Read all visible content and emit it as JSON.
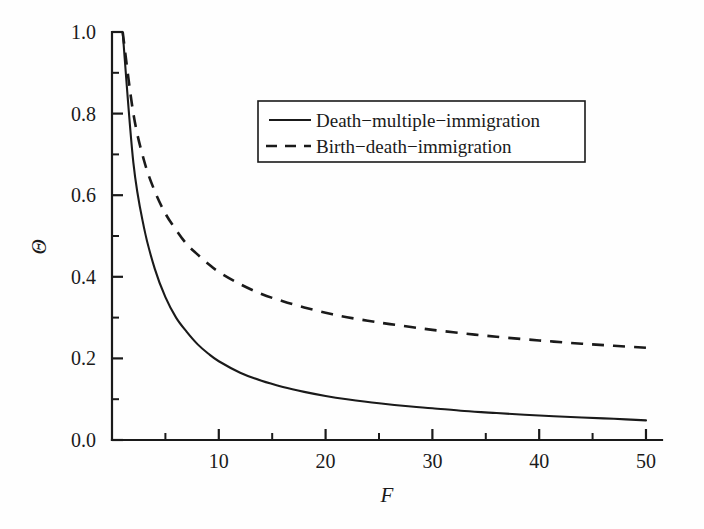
{
  "chart_data": {
    "type": "line",
    "title": "",
    "xlabel": "F",
    "ylabel": "Θ",
    "xlim": [
      0,
      51.5
    ],
    "ylim": [
      0.0,
      1.05
    ],
    "grid": false,
    "legend_position": "upper-center-right",
    "x_ticks_major": [
      10,
      20,
      30,
      40,
      50
    ],
    "x_ticks_major_labels": [
      "10",
      "20",
      "30",
      "40",
      "50"
    ],
    "x_ticks_minor": [
      5,
      15,
      25,
      35,
      45
    ],
    "y_ticks_major": [
      0.0,
      0.2,
      0.4,
      0.6,
      0.8,
      1.0
    ],
    "y_ticks_major_labels": [
      "0.0",
      "0.2",
      "0.4",
      "0.6",
      "0.8",
      "1.0"
    ],
    "y_ticks_minor": [
      0.1,
      0.3,
      0.5,
      0.7,
      0.9
    ],
    "x": [
      1,
      2,
      3,
      4,
      5,
      6,
      7,
      8,
      9,
      10,
      12,
      14,
      16,
      18,
      20,
      22,
      25,
      28,
      30,
      33,
      36,
      40,
      44,
      47,
      50
    ],
    "series": [
      {
        "name": "Death−multiple−immigration",
        "style": "solid",
        "color": "#1a1a1a",
        "values": [
          1.0,
          0.68,
          0.52,
          0.42,
          0.35,
          0.3,
          0.265,
          0.235,
          0.212,
          0.193,
          0.165,
          0.145,
          0.13,
          0.118,
          0.108,
          0.1,
          0.09,
          0.082,
          0.078,
          0.071,
          0.066,
          0.06,
          0.055,
          0.052,
          0.048
        ]
      },
      {
        "name": "Birth−death−immigration",
        "style": "dashed",
        "color": "#1a1a1a",
        "values": [
          1.0,
          0.8,
          0.685,
          0.61,
          0.555,
          0.515,
          0.48,
          0.455,
          0.432,
          0.412,
          0.382,
          0.358,
          0.34,
          0.325,
          0.312,
          0.301,
          0.288,
          0.277,
          0.27,
          0.261,
          0.253,
          0.244,
          0.236,
          0.231,
          0.226
        ]
      }
    ]
  },
  "legend": {
    "entries": [
      {
        "label": "Death−multiple−immigration",
        "style": "solid"
      },
      {
        "label": "Birth−death−immigration",
        "style": "dashed"
      }
    ]
  },
  "axes": {
    "x_title": "F",
    "y_title": "Θ"
  }
}
